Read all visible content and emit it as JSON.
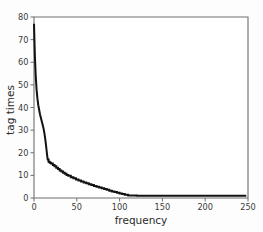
{
  "chart_data": {
    "type": "line",
    "title": "",
    "subtitle": "",
    "xlabel": "frequency",
    "ylabel": "tag times",
    "xlim": [
      0,
      250
    ],
    "ylim": [
      0,
      80
    ],
    "xticks": [
      0,
      50,
      100,
      150,
      200,
      250
    ],
    "yticks": [
      0,
      10,
      20,
      30,
      40,
      50,
      60,
      70,
      80
    ],
    "xtick_labels": [
      "0",
      "50",
      "100",
      "150",
      "200",
      "250"
    ],
    "ytick_labels": [
      "0",
      "10",
      "20",
      "30",
      "40",
      "50",
      "60",
      "70",
      "80"
    ],
    "grid": false,
    "legend": null,
    "legend_position": "none",
    "line_color": "#121212",
    "axis_color": "#6e6e6e",
    "background_color": "#ffffff",
    "annotations": [],
    "series": [
      {
        "name": "tag times",
        "x": [
          0,
          1,
          2,
          3,
          4,
          5,
          6,
          7,
          8,
          9,
          10,
          11,
          12,
          13,
          14,
          15,
          16,
          17,
          18,
          19,
          20,
          22,
          24,
          26,
          28,
          30,
          32,
          34,
          36,
          38,
          40,
          43,
          46,
          49,
          52,
          55,
          58,
          61,
          64,
          67,
          70,
          73,
          76,
          79,
          82,
          85,
          88,
          91,
          94,
          97,
          100,
          103,
          106,
          110,
          120,
          130,
          140,
          150,
          160,
          170,
          180,
          190,
          200,
          210,
          220,
          230,
          240,
          248
        ],
        "values": [
          77,
          63,
          54,
          48,
          44,
          41,
          39,
          37,
          35.5,
          34,
          32.5,
          31,
          29,
          26.5,
          23.5,
          20,
          17,
          16,
          15.8,
          15.5,
          15.2,
          14.6,
          14.0,
          13.4,
          12.8,
          12.2,
          11.7,
          11.2,
          10.7,
          10.2,
          9.8,
          9.2,
          8.7,
          8.2,
          7.7,
          7.3,
          6.9,
          6.5,
          6.1,
          5.7,
          5.3,
          5.0,
          4.6,
          4.3,
          4.0,
          3.6,
          3.2,
          2.9,
          2.6,
          2.3,
          2.0,
          1.8,
          1.4,
          1.1,
          1.0,
          1.0,
          1.0,
          1.0,
          1.0,
          1.0,
          1.0,
          1.0,
          1.0,
          1.0,
          1.0,
          1.0,
          1.0,
          1.0
        ]
      }
    ]
  },
  "axes": {
    "x_title": "frequency",
    "y_title": "tag times"
  }
}
